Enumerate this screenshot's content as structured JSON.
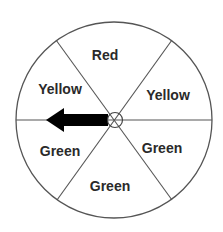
{
  "diagram": {
    "type": "spinner",
    "sections": [
      {
        "label": "Red",
        "x": 105,
        "y": 55
      },
      {
        "label": "Yellow",
        "x": 168,
        "y": 95
      },
      {
        "label": "Green",
        "x": 162,
        "y": 148
      },
      {
        "label": "Green",
        "x": 110,
        "y": 186
      },
      {
        "label": "Green",
        "x": 60,
        "y": 151
      },
      {
        "label": "Yellow",
        "x": 60,
        "y": 89
      }
    ],
    "pointer": {
      "direction": "left",
      "color": "#000000"
    },
    "colors": {
      "outline": "#555555",
      "text": "#2a2a2a",
      "background": "#ffffff"
    }
  }
}
